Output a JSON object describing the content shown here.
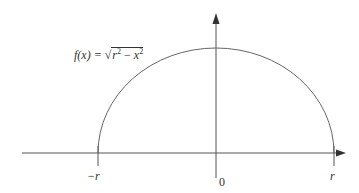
{
  "diagram": {
    "function_label": {
      "lhs": "f(x) = ",
      "sqrt_symbol": "√",
      "radicand_r": "r",
      "exp1": "2",
      "minus": " − ",
      "radicand_x": "x",
      "exp2": "2"
    },
    "axis_labels": {
      "neg_r": "−r",
      "zero": "0",
      "pos_r": "r"
    },
    "colors": {
      "curve": "#666666",
      "axes": "#555555",
      "text": "#333333"
    }
  }
}
